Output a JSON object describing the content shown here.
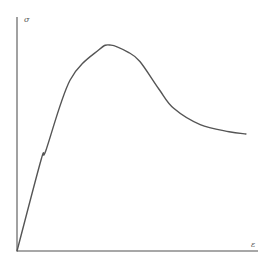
{
  "chart_data": {
    "type": "line",
    "title": "",
    "xlabel": "ε",
    "ylabel": "σ",
    "xlim": [
      0,
      1
    ],
    "ylim": [
      0,
      1
    ],
    "grid": false,
    "legend": null,
    "ticks": {
      "x": [],
      "y": []
    },
    "series": [
      {
        "name": "stress-strain curve",
        "x": [
          0.0,
          0.1,
          0.12,
          0.22,
          0.34,
          0.39,
          0.46,
          0.51,
          0.59,
          0.65,
          0.76,
          0.88,
          0.95
        ],
        "y": [
          0.0,
          0.39,
          0.43,
          0.73,
          0.86,
          0.88,
          0.85,
          0.81,
          0.69,
          0.61,
          0.54,
          0.51,
          0.5
        ]
      }
    ],
    "annotations": [
      "σ (vertical axis)",
      "ε (horizontal axis)"
    ]
  },
  "labels": {
    "y_axis": "σ",
    "x_axis": "ε"
  },
  "style": {
    "axis_color": "#8a8a8a",
    "curve_color": "#555555",
    "background": "#ffffff"
  }
}
